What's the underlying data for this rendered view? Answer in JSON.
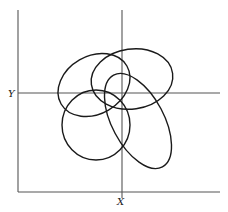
{
  "diagram": {
    "type": "overlapping-ellipses-on-axes",
    "labels": {
      "x_axis": "X",
      "y_axis": "Y"
    },
    "frame": {
      "left": 18,
      "right": 220,
      "top": 10,
      "bottom": 192
    },
    "axes": {
      "x_line_at_x": 122,
      "y_line_at_y": 93
    },
    "ellipses": [
      {
        "name": "upper-left",
        "cx": 94,
        "cy": 85,
        "rx": 38,
        "ry": 29,
        "rotate": -30
      },
      {
        "name": "upper-right",
        "cx": 132,
        "cy": 79,
        "rx": 41,
        "ry": 30,
        "rotate": -8
      },
      {
        "name": "lower-left",
        "cx": 96,
        "cy": 125,
        "rx": 34,
        "ry": 35,
        "rotate": 0
      },
      {
        "name": "lower-right-elongated",
        "cx": 138,
        "cy": 121,
        "rx": 52,
        "ry": 26,
        "rotate": 62
      }
    ],
    "colors": {
      "stroke": "#1a1a1a",
      "axis": "#555555",
      "background": "#ffffff"
    }
  }
}
